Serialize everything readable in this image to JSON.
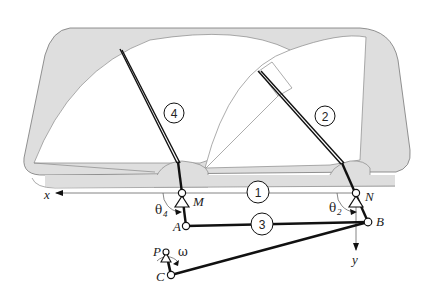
{
  "diagram": {
    "colors": {
      "frame_fill": "#dedede",
      "frame_stroke": "#777777",
      "sweep_fill": "#ffffff",
      "link": "#111111",
      "thin": "#888888"
    },
    "link_labels": {
      "frame": "1",
      "wiper_right": "2",
      "coupler": "3",
      "wiper_left": "4"
    },
    "point_labels": {
      "M": "M",
      "N": "N",
      "A": "A",
      "B": "B",
      "C": "C",
      "P": "P"
    },
    "axis_labels": {
      "x": "x",
      "y": "y"
    },
    "angle_labels": {
      "theta4": "θ",
      "theta4_sub": "4",
      "theta2": "θ",
      "theta2_sub": "2",
      "omega": "ω"
    }
  }
}
